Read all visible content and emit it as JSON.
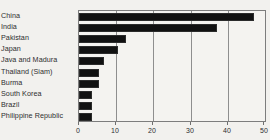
{
  "chart_data": {
    "type": "bar",
    "orientation": "horizontal",
    "title": "",
    "subtitle": "",
    "xlabel": "",
    "ylabel": "",
    "xlim": [
      0,
      50
    ],
    "xticks": [
      0,
      10,
      20,
      30,
      40,
      50
    ],
    "xtick_labels": [
      "0",
      "10",
      "20",
      "30",
      "40",
      "50"
    ],
    "grid": true,
    "grid_axis": "x",
    "legend": false,
    "legend_position": "none",
    "bar_color": "#111111",
    "plot_background": "#f4f3f0",
    "axis_color": "#7d7d7d",
    "categories": [
      "China",
      "India",
      "Pakistan",
      "Japan",
      "Java and Madura",
      "Thailand (Siam)",
      "Burma",
      "South Korea",
      "Brazil",
      "Philippine Republic"
    ],
    "values": [
      47,
      37,
      12.5,
      10.5,
      6.8,
      5.5,
      5.5,
      3.4,
      3.4,
      3.4
    ]
  }
}
